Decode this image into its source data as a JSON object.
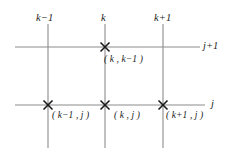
{
  "figure": {
    "type": "finite-difference-grid-stencil",
    "background_color": "#ffffff",
    "line_color": "#8c8c8c",
    "marker_color": "#1a1a1a",
    "text_color": "#1a1a1a"
  },
  "columns": [
    {
      "id": "k-minus-1",
      "label": "k−1",
      "x": 48
    },
    {
      "id": "k",
      "label": "k",
      "x": 105
    },
    {
      "id": "k-plus-1",
      "label": "k+1",
      "x": 163
    }
  ],
  "rows": [
    {
      "id": "j-plus-1",
      "label": "j+1",
      "y": 47
    },
    {
      "id": "j",
      "label": "j",
      "y": 105
    }
  ],
  "nodes": [
    {
      "id": "node-k-km1",
      "label": "( k , k−1 )",
      "x": 105,
      "y": 47
    },
    {
      "id": "node-km1-j",
      "label": "( k−1 , j )",
      "x": 48,
      "y": 105
    },
    {
      "id": "node-k-j",
      "label": "( k , j )",
      "x": 105,
      "y": 105
    },
    {
      "id": "node-kp1-j",
      "label": "( k+1 , j )",
      "x": 163,
      "y": 105
    }
  ],
  "geometry": {
    "horizontal_line_x_start": 15,
    "horizontal_line_x_end": 200,
    "vertical_line_y_start": 22,
    "vertical_line_y_end": 148,
    "marker_half_size": 4.5,
    "line_width": 1.1,
    "marker_line_width": 1.6
  }
}
